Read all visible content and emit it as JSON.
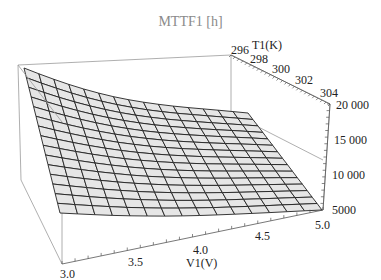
{
  "chart_data": {
    "type": "surface3d",
    "title": "MTTF1 [h]",
    "x_axis": {
      "label": "V1(V)",
      "ticks": [
        "3.0",
        "3.5",
        "4.0",
        "4.5",
        "5.0"
      ],
      "range": [
        3.0,
        5.0
      ]
    },
    "y_axis": {
      "label": "T1(K)",
      "ticks": [
        "296",
        "298",
        "300",
        "302",
        "304"
      ],
      "range": [
        295,
        305
      ]
    },
    "z_axis": {
      "label": "",
      "ticks": [
        "5000",
        "10 000",
        "15 000",
        "20 000"
      ],
      "range": [
        4000,
        20000
      ]
    },
    "mesh": {
      "rows": 15,
      "cols": 15
    },
    "surface_corners": {
      "V3.0_T295": 20000,
      "V5.0_T295": 9000,
      "V3.0_T305": 6500,
      "V5.0_T305": 4500
    },
    "grid": false,
    "box": true,
    "surface_color": "#e6e6e6",
    "mesh_color": "#222222"
  }
}
